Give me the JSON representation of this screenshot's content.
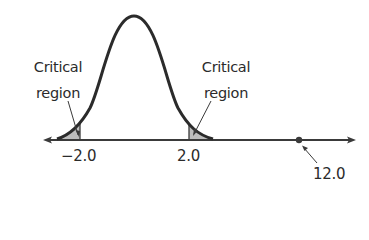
{
  "diagram": {
    "type": "normal-distribution-critical-regions",
    "left_label": {
      "line1": "Critical",
      "line2": "region"
    },
    "right_label": {
      "line1": "Critical",
      "line2": "region"
    },
    "ticks": [
      {
        "label": "−2.0",
        "value": -2.0
      },
      {
        "label": "2.0",
        "value": 2.0
      }
    ],
    "point": {
      "label": "12.0",
      "value": 12.0
    },
    "colors": {
      "curve": "#2b2b2b",
      "axis": "#3a3a3a",
      "shade": "#b8b8b8"
    }
  }
}
